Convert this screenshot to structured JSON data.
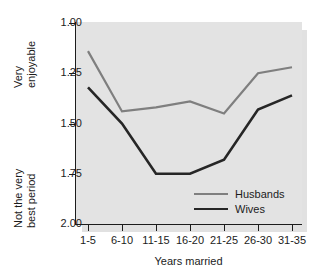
{
  "chart_data": {
    "type": "line",
    "title": "",
    "xlabel": "Years married",
    "ylabel_top": "Very\nenjoyable",
    "ylabel_bottom": "Not the very\nbest period",
    "categories": [
      "1-5",
      "6-10",
      "11-15",
      "16-20",
      "21-25",
      "26-30",
      "31-35"
    ],
    "series": [
      {
        "name": "Husbands",
        "color": "#7f7f7f",
        "values": [
          1.14,
          1.44,
          1.42,
          1.39,
          1.45,
          1.25,
          1.22
        ]
      },
      {
        "name": "Wives",
        "color": "#262626",
        "values": [
          1.32,
          1.5,
          1.75,
          1.75,
          1.68,
          1.43,
          1.36
        ]
      }
    ],
    "yticks": [
      "1.00",
      "1.25",
      "1.50",
      "1.75",
      "2.00"
    ],
    "ytick_values": [
      1.0,
      1.25,
      1.5,
      1.75,
      2.0
    ],
    "ylim": [
      1.0,
      2.0
    ],
    "y_axis_inverted": true,
    "grid": false,
    "legend_position": "inside-bottom-right",
    "plot_background": "#e3e3e3",
    "axis_color": "#1c1c1c"
  },
  "legend": {
    "entries": [
      {
        "label": "Husbands"
      },
      {
        "label": "Wives"
      }
    ]
  }
}
